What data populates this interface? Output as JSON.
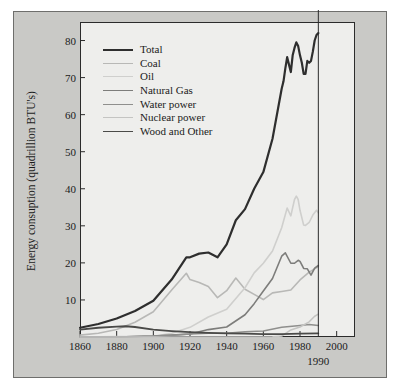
{
  "figure": {
    "background": "#ffffff",
    "panel_color": "#c9c9c6",
    "plot_background": "#eeeeec",
    "frame_color": "#2b2b2b"
  },
  "annotations": {
    "marker_year_label": "1990"
  },
  "chart_data": {
    "type": "line",
    "title": "",
    "xlabel": "",
    "ylabel": "Energy consuption (quadrillion BTU's)",
    "xlim": [
      1860,
      2010
    ],
    "ylim": [
      0,
      85
    ],
    "xticks": [
      1860,
      1880,
      1900,
      1920,
      1940,
      1960,
      1980,
      2000
    ],
    "xtick_labels": [
      "1860",
      "1880",
      "1900",
      "1920",
      "1940",
      "1960",
      "1980",
      "2000"
    ],
    "yticks": [
      10,
      20,
      30,
      40,
      50,
      60,
      70,
      80
    ],
    "ytick_labels": [
      "10",
      "20",
      "30",
      "40",
      "50",
      "60",
      "70",
      "80"
    ],
    "grid": false,
    "legend_position": "upper left inside axes",
    "vertical_reference_line": 1990,
    "series": [
      {
        "name": "Total",
        "color": "#2e2e2e",
        "width": 2.2,
        "x": [
          1860,
          1870,
          1880,
          1890,
          1900,
          1910,
          1918,
          1920,
          1925,
          1930,
          1935,
          1940,
          1945,
          1950,
          1955,
          1960,
          1965,
          1970,
          1971,
          1972,
          1973,
          1974,
          1975,
          1976,
          1977,
          1978,
          1979,
          1980,
          1981,
          1982,
          1983,
          1984,
          1985,
          1986,
          1987,
          1988,
          1989,
          1990
        ],
        "values": [
          2.5,
          3.5,
          5.0,
          7.0,
          9.8,
          15.5,
          21.5,
          21.5,
          22.5,
          22.8,
          21.5,
          25.0,
          31.5,
          34.5,
          40.0,
          44.5,
          53.5,
          67.0,
          69.0,
          72.5,
          75.5,
          73.5,
          71.5,
          76.0,
          78.0,
          79.5,
          78.5,
          76.0,
          74.0,
          71.0,
          71.0,
          74.5,
          74.0,
          74.5,
          77.0,
          80.0,
          81.5,
          82.0
        ]
      },
      {
        "name": "Coal",
        "color": "#b8b8b6",
        "width": 1.6,
        "x": [
          1860,
          1870,
          1880,
          1890,
          1900,
          1910,
          1918,
          1920,
          1925,
          1930,
          1935,
          1940,
          1945,
          1950,
          1955,
          1960,
          1965,
          1970,
          1975,
          1980,
          1985,
          1990
        ],
        "values": [
          0.5,
          1.0,
          2.0,
          4.0,
          6.8,
          12.7,
          17.2,
          15.5,
          14.7,
          13.6,
          10.6,
          12.5,
          15.9,
          12.9,
          11.5,
          10.1,
          11.9,
          12.3,
          12.7,
          15.4,
          17.5,
          19.0
        ]
      },
      {
        "name": "Oil",
        "color": "#cfcfcd",
        "width": 1.6,
        "x": [
          1860,
          1880,
          1900,
          1910,
          1920,
          1930,
          1940,
          1950,
          1955,
          1960,
          1965,
          1970,
          1973,
          1975,
          1977,
          1978,
          1979,
          1980,
          1982,
          1983,
          1985,
          1987,
          1989,
          1990
        ],
        "values": [
          0.0,
          0.1,
          0.2,
          1.0,
          2.6,
          5.4,
          7.5,
          13.3,
          17.3,
          19.9,
          23.2,
          29.5,
          34.8,
          32.7,
          37.1,
          38.0,
          37.1,
          34.2,
          30.2,
          30.1,
          30.9,
          32.9,
          34.2,
          33.5
        ]
      },
      {
        "name": "Natural Gas",
        "color": "#7d7d7b",
        "width": 1.6,
        "x": [
          1860,
          1880,
          1900,
          1910,
          1920,
          1930,
          1940,
          1950,
          1955,
          1960,
          1965,
          1970,
          1972,
          1975,
          1977,
          1979,
          1980,
          1982,
          1984,
          1986,
          1988,
          1990
        ],
        "values": [
          0.0,
          0.0,
          0.25,
          0.5,
          0.8,
          2.0,
          2.7,
          6.0,
          9.0,
          12.4,
          15.8,
          21.8,
          22.7,
          19.9,
          19.9,
          20.7,
          20.4,
          18.5,
          18.4,
          16.7,
          18.6,
          19.3
        ]
      },
      {
        "name": "Water power",
        "color": "#8f8f8d",
        "width": 1.5,
        "x": [
          1860,
          1880,
          1900,
          1910,
          1920,
          1930,
          1940,
          1950,
          1960,
          1970,
          1980,
          1985,
          1990
        ],
        "values": [
          0.0,
          0.0,
          0.25,
          0.5,
          0.8,
          1.0,
          1.0,
          1.4,
          1.6,
          2.6,
          3.1,
          3.4,
          3.1
        ]
      },
      {
        "name": "Nuclear power",
        "color": "#c4c4c2",
        "width": 1.5,
        "x": [
          1860,
          1950,
          1960,
          1965,
          1970,
          1975,
          1980,
          1985,
          1988,
          1990
        ],
        "values": [
          0.0,
          0.0,
          0.0,
          0.04,
          0.24,
          1.9,
          2.7,
          4.1,
          5.6,
          6.2
        ]
      },
      {
        "name": "Wood and Other",
        "color": "#4a4a48",
        "width": 1.8,
        "x": [
          1860,
          1870,
          1880,
          1885,
          1890,
          1900,
          1910,
          1920,
          1930,
          1940,
          1950,
          1960,
          1970,
          1980,
          1990
        ],
        "values": [
          2.0,
          2.5,
          2.8,
          2.9,
          2.7,
          2.0,
          1.6,
          1.3,
          1.1,
          1.0,
          0.9,
          0.8,
          0.8,
          0.9,
          1.0
        ]
      }
    ]
  }
}
